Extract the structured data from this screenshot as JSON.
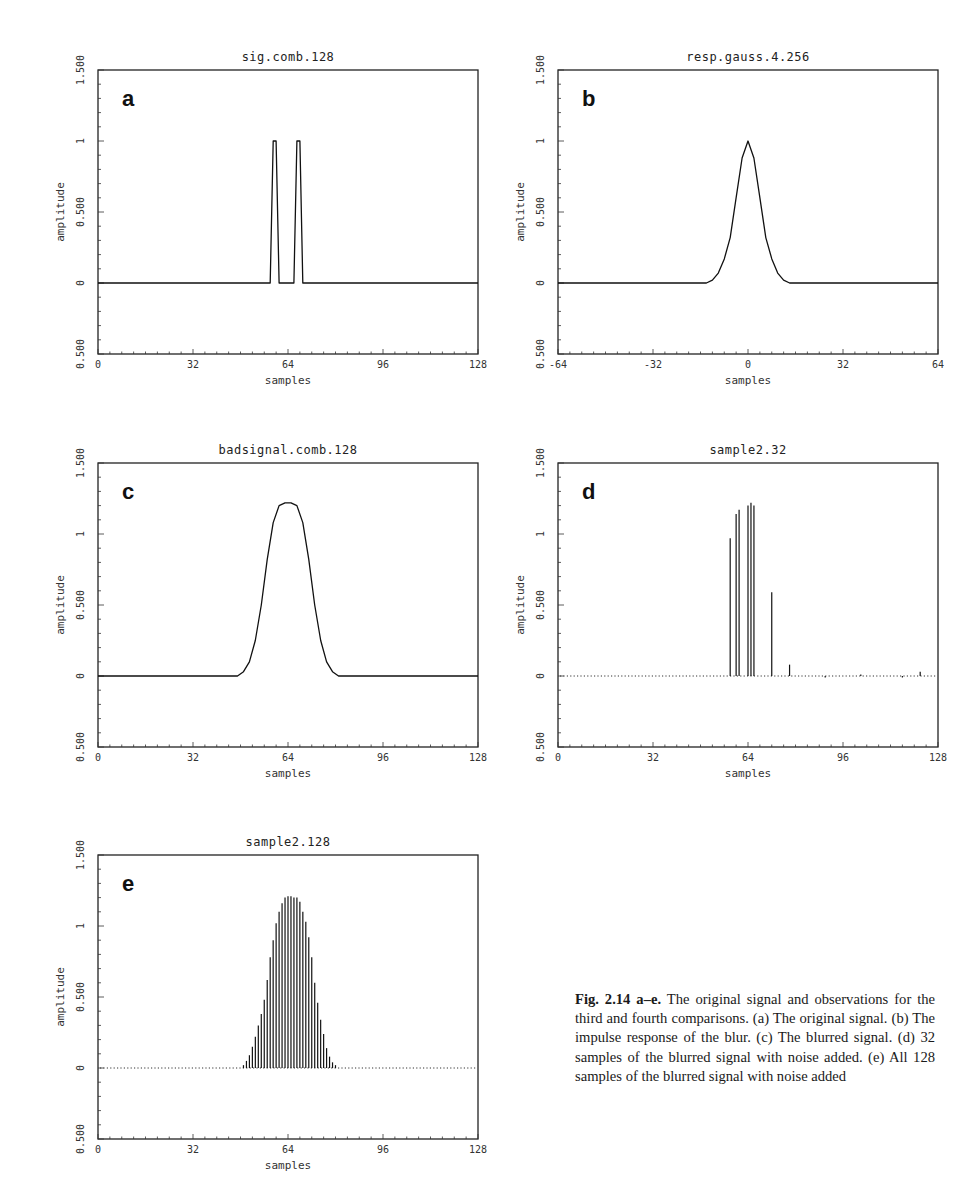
{
  "figure": {
    "caption_label": "Fig. 2.14 a–e.",
    "caption_text": "The original signal and observations for the third and fourth comparisons. (a) The original signal. (b) The impulse response of the blur. (c) The blurred signal. (d) 32 samples of the blurred signal with noise added. (e) All 128 samples of the blurred signal with noise added"
  },
  "chart_data": [
    {
      "id": "a",
      "type": "line",
      "title": "sig.comb.128",
      "panel_letter": "a",
      "xlabel": "samples",
      "ylabel": "amplitude",
      "xlim": [
        0,
        128
      ],
      "ylim": [
        -0.5,
        1.5
      ],
      "xticks": [
        "0",
        "32",
        "64",
        "96",
        "128"
      ],
      "yticks": [
        "-0.500",
        "0",
        "0.500",
        "1",
        "1.500"
      ],
      "grid": false,
      "x": [
        0,
        58,
        59,
        60,
        61,
        66,
        67,
        68,
        69,
        128
      ],
      "values": [
        0,
        0,
        1,
        1,
        0,
        0,
        1,
        1,
        0,
        0
      ],
      "description": "Two narrow impulses of amplitude 1 near samples 59 and 67"
    },
    {
      "id": "b",
      "type": "line",
      "title": "resp.gauss.4.256",
      "panel_letter": "b",
      "xlabel": "samples",
      "ylabel": "amplitude",
      "xlim": [
        -64,
        64
      ],
      "ylim": [
        -0.5,
        1.5
      ],
      "xticks": [
        "-64",
        "-32",
        "0",
        "32",
        "64"
      ],
      "yticks": [
        "-0.500",
        "0",
        "0.500",
        "1",
        "1.500"
      ],
      "grid": false,
      "x": [
        -64,
        -14,
        -12,
        -10,
        -8,
        -6,
        -4,
        -2,
        0,
        2,
        4,
        6,
        8,
        10,
        12,
        14,
        64
      ],
      "values": [
        0,
        0,
        0.02,
        0.07,
        0.17,
        0.32,
        0.6,
        0.88,
        1.0,
        0.88,
        0.6,
        0.32,
        0.17,
        0.07,
        0.02,
        0,
        0
      ],
      "description": "Gaussian impulse response centered at 0 with peak 1"
    },
    {
      "id": "c",
      "type": "line",
      "title": "badsignal.comb.128",
      "panel_letter": "c",
      "xlabel": "samples",
      "ylabel": "amplitude",
      "xlim": [
        0,
        128
      ],
      "ylim": [
        -0.5,
        1.5
      ],
      "xticks": [
        "0",
        "32",
        "64",
        "96",
        "128"
      ],
      "yticks": [
        "-0.500",
        "0",
        "0.500",
        "1",
        "1.500"
      ],
      "grid": false,
      "x": [
        0,
        47,
        49,
        51,
        53,
        55,
        57,
        59,
        61,
        63,
        65,
        67,
        69,
        71,
        73,
        75,
        77,
        79,
        81,
        128
      ],
      "values": [
        0,
        0,
        0.03,
        0.1,
        0.25,
        0.5,
        0.82,
        1.08,
        1.2,
        1.22,
        1.22,
        1.2,
        1.08,
        0.82,
        0.5,
        0.25,
        0.1,
        0.03,
        0,
        0
      ],
      "description": "Blurred signal: smooth broad pulse peaking ~1.22 around sample 64"
    },
    {
      "id": "d",
      "type": "bar",
      "title": "sample2.32",
      "panel_letter": "d",
      "xlabel": "samples",
      "ylabel": "amplitude",
      "xlim": [
        0,
        128
      ],
      "ylim": [
        -0.5,
        1.5
      ],
      "xticks": [
        "0",
        "32",
        "64",
        "96",
        "128"
      ],
      "yticks": [
        "-0.500",
        "0",
        "0.500",
        "1",
        "1.500"
      ],
      "grid": false,
      "baseline": "dotted",
      "x": [
        58,
        60,
        61,
        64,
        65,
        66,
        72,
        78,
        90,
        102,
        116,
        122
      ],
      "values": [
        0.97,
        1.14,
        1.17,
        1.2,
        1.22,
        1.2,
        0.59,
        0.08,
        -0.01,
        0.01,
        -0.01,
        0.03
      ],
      "description": "32 noisy samples of the blurred signal (stems)"
    },
    {
      "id": "e",
      "type": "bar",
      "title": "sample2.128",
      "panel_letter": "e",
      "xlabel": "samples",
      "ylabel": "amplitude",
      "xlim": [
        0,
        128
      ],
      "ylim": [
        -0.5,
        1.5
      ],
      "xticks": [
        "0",
        "32",
        "64",
        "96",
        "128"
      ],
      "yticks": [
        "-0.500",
        "0",
        "0.500",
        "1",
        "1.500"
      ],
      "grid": false,
      "baseline": "dotted",
      "x": [
        49,
        50,
        51,
        52,
        53,
        54,
        55,
        56,
        57,
        58,
        59,
        60,
        61,
        62,
        63,
        64,
        65,
        66,
        67,
        68,
        69,
        70,
        71,
        72,
        73,
        74,
        75,
        76,
        77,
        78,
        79,
        80
      ],
      "values": [
        0.02,
        0.05,
        0.09,
        0.15,
        0.22,
        0.3,
        0.38,
        0.48,
        0.62,
        0.78,
        0.9,
        1.02,
        1.1,
        1.16,
        1.2,
        1.21,
        1.21,
        1.2,
        1.2,
        1.17,
        1.1,
        1.03,
        0.92,
        0.78,
        0.6,
        0.46,
        0.34,
        0.24,
        0.14,
        0.08,
        0.04,
        0.02
      ],
      "description": "All 128 noisy samples of the blurred signal (stems); off-pulse samples are near 0"
    }
  ]
}
